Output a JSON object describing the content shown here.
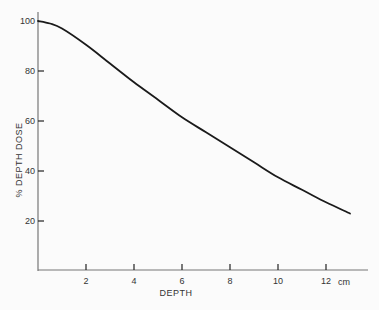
{
  "chart_data": {
    "type": "line",
    "title": "",
    "xlabel": "DEPTH",
    "xunit": "cm",
    "ylabel": "% DEPTH DOSE",
    "xlim": [
      0,
      13.5
    ],
    "ylim": [
      0,
      100
    ],
    "x_ticks": [
      2,
      4,
      6,
      8,
      10,
      12
    ],
    "y_ticks": [
      20,
      40,
      60,
      80,
      100
    ],
    "grid": false,
    "legend": null,
    "series": [
      {
        "name": "% depth dose",
        "x": [
          0,
          0.5,
          1,
          2,
          3,
          4,
          5,
          6,
          7,
          8,
          9,
          10,
          11,
          12,
          13
        ],
        "y": [
          100,
          99,
          97,
          90.5,
          83,
          75.5,
          68.5,
          61.5,
          55.5,
          49.5,
          43.5,
          37.5,
          32.5,
          27.5,
          23
        ]
      }
    ]
  },
  "colors": {
    "background": "#fbfbfb",
    "axis": "#777777",
    "curve": "#1a1a1a",
    "text": "#333333"
  }
}
